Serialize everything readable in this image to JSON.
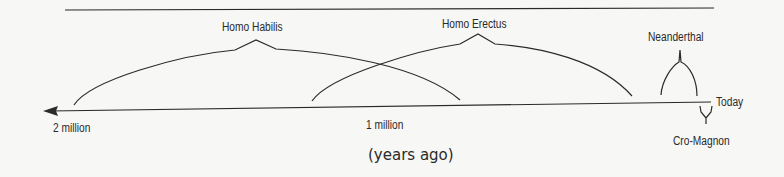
{
  "diagram": {
    "axis": {
      "left_label": "2 million",
      "mid_label": "1 million",
      "right_label": "Today",
      "unit_label": "(years ago)"
    },
    "species": [
      {
        "name": "Homo Habilis"
      },
      {
        "name": "Homo Erectus"
      },
      {
        "name": "Neanderthal"
      },
      {
        "name": "Cro-Magnon"
      }
    ],
    "colors": {
      "ink": "#2a2a2a",
      "background": "#f7f7f5"
    }
  }
}
